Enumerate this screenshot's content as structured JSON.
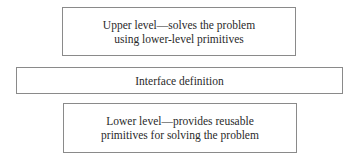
{
  "diagram": {
    "layers": [
      {
        "id": "upper",
        "lines": [
          "Upper level—solves the problem",
          "using lower-level primitives"
        ]
      },
      {
        "id": "interface",
        "lines": [
          "Interface definition"
        ]
      },
      {
        "id": "lower",
        "lines": [
          "Lower level—provides reusable",
          "primitives for solving the problem"
        ]
      }
    ],
    "colors": {
      "border": "#8a8a8a",
      "text": "#2a2a2a",
      "background": "#ffffff"
    }
  }
}
